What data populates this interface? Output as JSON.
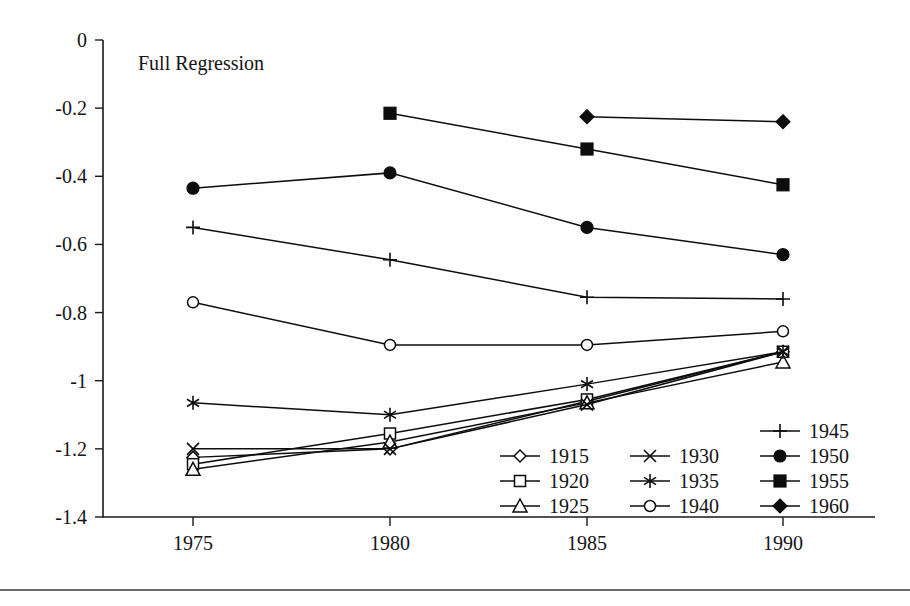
{
  "chart_data": {
    "type": "line",
    "title": "Full Regression",
    "xlabel": "",
    "ylabel": "",
    "x": [
      1975,
      1980,
      1985,
      1990
    ],
    "xtick_labels": [
      "1975",
      "1980",
      "1985",
      "1990"
    ],
    "ytick_labels": [
      "0",
      "-0.2",
      "-0.4",
      "-0.6",
      "-0.8",
      "-1",
      "-1.2",
      "-1.4"
    ],
    "ytick_values": [
      0,
      -0.2,
      -0.4,
      -0.6,
      -0.8,
      -1,
      -1.2,
      -1.4
    ],
    "ylim": [
      -1.4,
      0
    ],
    "xlim": [
      1975,
      1990
    ],
    "grid": false,
    "legend_position": "inside-bottom-right",
    "series": [
      {
        "name": "1915",
        "marker": "open-diamond",
        "values": [
          -1.225,
          -1.2,
          -1.06,
          -0.915
        ]
      },
      {
        "name": "1920",
        "marker": "open-square",
        "values": [
          -1.245,
          -1.155,
          -1.055,
          -0.915
        ]
      },
      {
        "name": "1925",
        "marker": "open-triangle",
        "values": [
          -1.26,
          -1.18,
          -1.065,
          -0.945
        ]
      },
      {
        "name": "1930",
        "marker": "cross-x",
        "values": [
          -1.2,
          -1.2,
          -1.07,
          -0.915
        ]
      },
      {
        "name": "1935",
        "marker": "asterisk",
        "values": [
          -1.065,
          -1.1,
          -1.01,
          -0.915
        ]
      },
      {
        "name": "1940",
        "marker": "open-circle",
        "values": [
          -0.77,
          -0.895,
          -0.895,
          -0.855
        ]
      },
      {
        "name": "1945",
        "marker": "plus",
        "values": [
          -0.55,
          -0.645,
          -0.755,
          -0.76
        ]
      },
      {
        "name": "1950",
        "marker": "filled-circle",
        "values": [
          -0.435,
          -0.39,
          -0.55,
          -0.63
        ]
      },
      {
        "name": "1955",
        "marker": "filled-square",
        "values": [
          null,
          -0.215,
          -0.32,
          -0.425
        ]
      },
      {
        "name": "1960",
        "marker": "filled-diamond",
        "values": [
          null,
          null,
          -0.225,
          -0.24
        ]
      }
    ],
    "legend_columns": [
      [
        "1915",
        "1920",
        "1925"
      ],
      [
        "1930",
        "1935",
        "1940"
      ],
      [
        "1945",
        "1950",
        "1955",
        "1960"
      ]
    ]
  },
  "colors": {
    "ink": "#0d0d0d",
    "background": "#fefefe"
  }
}
